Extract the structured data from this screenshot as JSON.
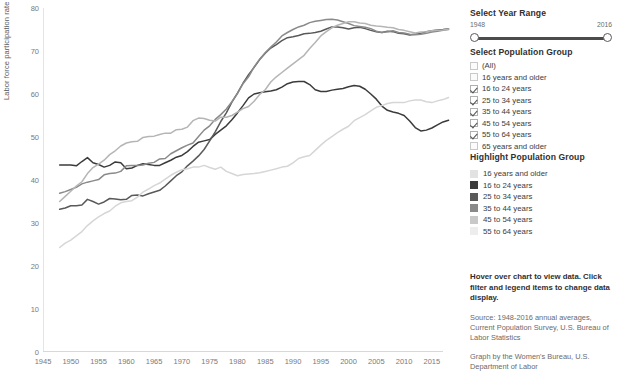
{
  "chart_data": {
    "type": "line",
    "title": "",
    "xlabel": "",
    "ylabel": "Labor force participation rate (%)",
    "xlim": [
      1945,
      2017
    ],
    "ylim": [
      0,
      80
    ],
    "yticks": [
      0,
      10,
      20,
      30,
      40,
      50,
      60,
      70,
      80
    ],
    "xticks": [
      1945,
      1950,
      1955,
      1960,
      1965,
      1970,
      1975,
      1980,
      1985,
      1990,
      1995,
      2000,
      2005,
      2010,
      2015
    ],
    "grid": false,
    "legend_position": "right-panel",
    "x_start": 1948,
    "x_end": 2016,
    "series": [
      {
        "name": "16 to 24 years",
        "color": "#3b3b3b",
        "values": [
          43.5,
          43.5,
          43.5,
          43.3,
          44.3,
          45.2,
          44.0,
          43.6,
          43.0,
          43.4,
          44.2,
          44.0,
          42.6,
          42.8,
          43.4,
          43.8,
          43.6,
          43.4,
          43.4,
          44.0,
          44.6,
          45.3,
          45.7,
          46.6,
          47.8,
          48.8,
          49.1,
          49.4,
          50.6,
          51.6,
          52.6,
          54.0,
          55.6,
          57.3,
          59.1,
          60.0,
          60.3,
          60.5,
          60.7,
          61.0,
          61.6,
          62.4,
          62.8,
          62.9,
          62.9,
          62.2,
          61.0,
          60.6,
          60.6,
          60.9,
          61.1,
          61.3,
          61.7,
          62.0,
          61.8,
          61.1,
          60.0,
          58.8,
          57.2,
          56.2,
          55.8,
          55.5,
          55.0,
          53.7,
          52.2,
          51.4,
          51.6,
          52.1,
          52.8,
          53.5,
          53.9
        ]
      },
      {
        "name": "25 to 34 years",
        "color": "#595959",
        "values": [
          33.2,
          33.5,
          34.0,
          34.0,
          34.2,
          35.5,
          35.0,
          34.4,
          34.9,
          35.7,
          35.6,
          35.4,
          35.5,
          36.4,
          36.5,
          36.3,
          36.8,
          37.2,
          37.6,
          38.6,
          39.8,
          41.0,
          41.9,
          43.3,
          44.4,
          45.6,
          47.1,
          49.1,
          51.2,
          53.6,
          55.6,
          58.1,
          60.2,
          62.5,
          64.5,
          66.2,
          68.0,
          69.5,
          70.7,
          71.5,
          72.4,
          73.1,
          73.3,
          73.6,
          74.0,
          74.1,
          74.3,
          74.6,
          75.1,
          75.6,
          75.6,
          75.4,
          75.1,
          75.4,
          75.5,
          75.2,
          74.8,
          74.5,
          74.3,
          74.6,
          74.5,
          74.1,
          74.0,
          73.7,
          73.9,
          74.1,
          74.5,
          74.7,
          74.9,
          75.0,
          75.2
        ]
      },
      {
        "name": "35 to 44 years",
        "color": "#8a8a8a",
        "values": [
          36.9,
          37.3,
          37.8,
          38.3,
          39.1,
          39.5,
          39.8,
          40.1,
          41.2,
          41.5,
          41.6,
          42.0,
          43.3,
          43.4,
          43.4,
          43.5,
          43.9,
          44.1,
          44.9,
          45.0,
          46.1,
          46.8,
          47.5,
          48.1,
          48.6,
          50.1,
          51.6,
          52.6,
          54.1,
          55.2,
          56.5,
          58.2,
          60.1,
          62.4,
          64.0,
          66.3,
          68.1,
          69.6,
          70.9,
          72.1,
          73.5,
          74.3,
          75.0,
          75.6,
          76.0,
          76.6,
          76.9,
          77.1,
          77.3,
          77.4,
          77.2,
          76.8,
          76.4,
          75.9,
          75.7,
          75.5,
          75.2,
          74.6,
          74.3,
          74.5,
          74.7,
          74.3,
          74.2,
          73.9,
          73.8,
          73.9,
          74.1,
          74.4,
          74.6,
          74.8,
          75.0
        ]
      },
      {
        "name": "45 to 54 years",
        "color": "#b5b5b5",
        "values": [
          35.0,
          36.2,
          37.4,
          38.6,
          39.6,
          41.5,
          42.9,
          43.7,
          44.6,
          45.9,
          46.8,
          47.9,
          48.6,
          48.9,
          49.0,
          49.9,
          50.1,
          50.2,
          50.6,
          50.9,
          50.9,
          51.7,
          51.8,
          52.3,
          53.8,
          54.4,
          54.3,
          53.9,
          53.7,
          54.6,
          54.6,
          55.0,
          55.8,
          56.6,
          57.1,
          58.3,
          59.9,
          61.0,
          62.8,
          64.0,
          65.0,
          66.0,
          67.0,
          68.0,
          69.0,
          70.6,
          72.0,
          73.5,
          74.5,
          75.4,
          76.0,
          76.4,
          76.8,
          76.8,
          76.5,
          76.4,
          76.0,
          75.8,
          75.7,
          75.5,
          75.4,
          75.0,
          74.8,
          74.5,
          74.2,
          74.4,
          74.5,
          74.7,
          74.8,
          74.9,
          75.1
        ]
      },
      {
        "name": "55 to 64 years",
        "color": "#d6d6d6",
        "values": [
          24.3,
          25.3,
          26.0,
          27.0,
          28.0,
          29.4,
          30.5,
          31.4,
          32.2,
          32.8,
          33.9,
          34.7,
          35.0,
          35.2,
          36.0,
          37.2,
          37.9,
          38.7,
          39.3,
          40.2,
          41.1,
          41.8,
          42.4,
          42.6,
          43.0,
          43.0,
          43.4,
          42.9,
          42.5,
          43.0,
          42.0,
          41.5,
          41.0,
          41.3,
          41.4,
          41.5,
          41.7,
          42.0,
          42.3,
          42.6,
          43.0,
          43.2,
          44.0,
          45.0,
          45.4,
          45.7,
          46.9,
          48.1,
          49.2,
          50.1,
          51.0,
          51.8,
          52.5,
          53.8,
          54.5,
          55.2,
          56.1,
          56.9,
          57.3,
          57.8,
          58.0,
          58.0,
          58.0,
          58.4,
          58.6,
          58.6,
          58.2,
          58.0,
          58.4,
          58.7,
          59.2
        ]
      }
    ]
  },
  "year_range": {
    "title": "Select Year Range",
    "start_label": "1948",
    "end_label": "2016"
  },
  "population_group": {
    "title": "Select Population Group",
    "options": [
      {
        "label": "(All)",
        "checked": false
      },
      {
        "label": "16 years and older",
        "checked": false
      },
      {
        "label": "16 to 24 years",
        "checked": true
      },
      {
        "label": "25 to 34 years",
        "checked": true
      },
      {
        "label": "35 to 44 years",
        "checked": true
      },
      {
        "label": "45 to 54 years",
        "checked": true
      },
      {
        "label": "55 to 64 years",
        "checked": true
      },
      {
        "label": "65 years and older",
        "checked": false
      }
    ]
  },
  "highlight_group": {
    "title": "Highlight Population Group",
    "items": [
      {
        "label": "16 years and older",
        "color": "#e2e2e2"
      },
      {
        "label": "16 to 24 years",
        "color": "#3b3b3b"
      },
      {
        "label": "25 to 34 years",
        "color": "#595959"
      },
      {
        "label": "35 to 44 years",
        "color": "#8a8a8a"
      },
      {
        "label": "45 to 54 years",
        "color": "#c9c9c9"
      },
      {
        "label": "55 to 64 years",
        "color": "#ededed"
      }
    ]
  },
  "notes": {
    "instructions": "Hover over chart to view data. Click filter and legend items to change data display.",
    "source": "Source: 1948-2016 annual averages, Current Population Survey, U.S. Bureau of Labor Statistics",
    "credit": "Graph by the Women's Bureau, U.S. Department of Labor"
  }
}
